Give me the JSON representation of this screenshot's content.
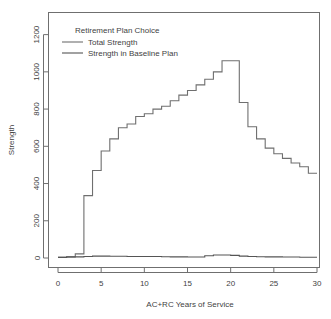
{
  "chart_data": {
    "type": "line",
    "title": "",
    "xlabel": "AC+RC Years of Service",
    "ylabel": "Strength",
    "xlim": [
      0,
      30
    ],
    "ylim": [
      0,
      1300
    ],
    "grid": false,
    "step_style": "hv",
    "xticks": [
      0,
      5,
      10,
      15,
      20,
      25,
      30
    ],
    "xtick_labels": [
      "0",
      "5",
      "10",
      "15",
      "20",
      "25",
      "30"
    ],
    "yticks": [
      0,
      200,
      400,
      600,
      800,
      1000,
      1200
    ],
    "ytick_labels": [
      "0",
      "200",
      "400",
      "600",
      "800",
      "1000",
      "1200"
    ],
    "legend": {
      "title": "Retirement Plan Choice",
      "position": "top-left",
      "entries": [
        {
          "name": "Total Strength",
          "color": "#6f6f6f"
        },
        {
          "name": "Strength in Baseline Plan",
          "color": "#555555"
        }
      ]
    },
    "x": [
      0,
      1,
      2,
      3,
      4,
      5,
      6,
      7,
      8,
      9,
      10,
      11,
      12,
      13,
      14,
      15,
      16,
      17,
      18,
      19,
      20,
      21,
      22,
      23,
      24,
      25,
      26,
      27,
      28,
      29
    ],
    "series": [
      {
        "name": "Total Strength",
        "color": "#6f6f6f",
        "values": [
          5,
          8,
          22,
          335,
          470,
          575,
          640,
          700,
          720,
          760,
          775,
          800,
          815,
          845,
          875,
          900,
          930,
          960,
          1000,
          1060,
          1060,
          835,
          705,
          640,
          590,
          560,
          535,
          510,
          490,
          455
        ]
      },
      {
        "name": "Strength in Baseline Plan",
        "color": "#555555",
        "values": [
          3,
          4,
          6,
          8,
          10,
          10,
          9,
          9,
          8,
          8,
          8,
          8,
          7,
          6,
          6,
          5,
          5,
          12,
          16,
          16,
          14,
          10,
          8,
          7,
          6,
          6,
          5,
          5,
          4,
          4
        ]
      }
    ]
  },
  "colors": {
    "axis": "#6f6f6f",
    "text": "#3f3f3f",
    "background": "#ffffff"
  }
}
